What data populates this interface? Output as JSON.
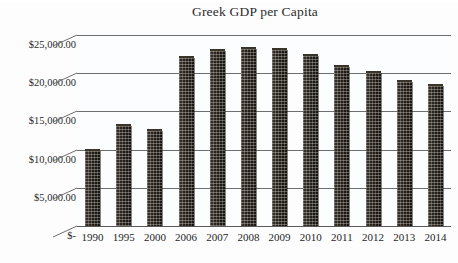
{
  "chart_data": {
    "type": "bar",
    "title": "Greek GDP per Capita",
    "xlabel": "",
    "ylabel": "",
    "categories": [
      "1990",
      "1995",
      "2000",
      "2006",
      "2007",
      "2008",
      "2009",
      "2010",
      "2011",
      "2012",
      "2013",
      "2014"
    ],
    "values": [
      9800,
      13100,
      12400,
      22000,
      22900,
      23200,
      23100,
      22300,
      20800,
      20000,
      18900,
      18300
    ],
    "ylim": [
      0,
      25000
    ],
    "ytick_values": [
      25000,
      20000,
      15000,
      10000,
      5000,
      0
    ],
    "ytick_labels": [
      "$25,000.00",
      "$20,000.00",
      "$15,000.00",
      "$10,000.00",
      "$5,000.00",
      "$-"
    ],
    "grid": true,
    "legend": false,
    "legend_position": "none",
    "bar_color": "#241f18",
    "gridline_color": "#6e6e6e",
    "background_color": "#fcfdff",
    "series": [
      {
        "name": "Greek GDP per Capita",
        "values": [
          9800,
          13100,
          12400,
          22000,
          22900,
          23200,
          23100,
          22300,
          20800,
          20000,
          18900,
          18300
        ]
      }
    ]
  },
  "chart": {
    "title": "Greek GDP per Capita",
    "y_axis": {
      "ticks": [
        {
          "label": "$25,000.00",
          "value": 25000
        },
        {
          "label": "$20,000.00",
          "value": 20000
        },
        {
          "label": "$15,000.00",
          "value": 15000
        },
        {
          "label": "$10,000.00",
          "value": 10000
        },
        {
          "label": "$5,000.00",
          "value": 5000
        },
        {
          "label": "$-",
          "value": 0
        }
      ]
    },
    "x_axis": {
      "ticks": [
        {
          "label": "1990"
        },
        {
          "label": "1995"
        },
        {
          "label": "2000"
        },
        {
          "label": "2006"
        },
        {
          "label": "2007"
        },
        {
          "label": "2008"
        },
        {
          "label": "2009"
        },
        {
          "label": "2010"
        },
        {
          "label": "2011"
        },
        {
          "label": "2012"
        },
        {
          "label": "2013"
        },
        {
          "label": "2014"
        }
      ]
    },
    "bars": [
      {
        "category": "1990",
        "value": 9800
      },
      {
        "category": "1995",
        "value": 13100
      },
      {
        "category": "2000",
        "value": 12400
      },
      {
        "category": "2006",
        "value": 22000
      },
      {
        "category": "2007",
        "value": 22900
      },
      {
        "category": "2008",
        "value": 23200
      },
      {
        "category": "2009",
        "value": 23100
      },
      {
        "category": "2010",
        "value": 22300
      },
      {
        "category": "2011",
        "value": 20800
      },
      {
        "category": "2012",
        "value": 20000
      },
      {
        "category": "2013",
        "value": 18900
      },
      {
        "category": "2014",
        "value": 18300
      }
    ]
  }
}
